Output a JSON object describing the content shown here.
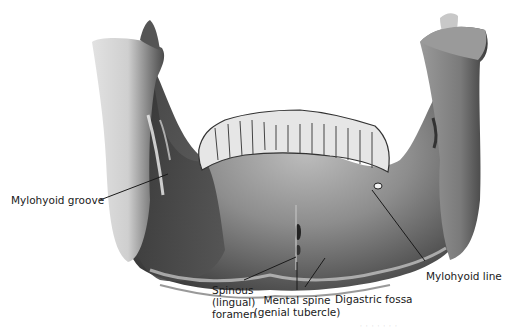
{
  "figure": {
    "colors": {
      "background": "#ffffff",
      "bone_light": "#d9d9d9",
      "bone_mid": "#8a8a8a",
      "bone_dark": "#3a3a3a",
      "leader_line": "#1a1a1a"
    }
  },
  "labels": [
    {
      "id": "mylohyoid-groove",
      "text": "Mylohyoid groove"
    },
    {
      "id": "spinous-foramen",
      "lines": [
        "Spinous",
        "(lingual)",
        "foramen"
      ]
    },
    {
      "id": "mental-spine",
      "lines": [
        "Mental spine",
        "(genial tubercle)"
      ]
    },
    {
      "id": "digastric-fossa",
      "text": "Digastric fossa"
    },
    {
      "id": "mylohyoid-line",
      "text": "Mylohyoid line"
    }
  ],
  "caption": {
    "text": "· · ·  · ·  · ·"
  }
}
